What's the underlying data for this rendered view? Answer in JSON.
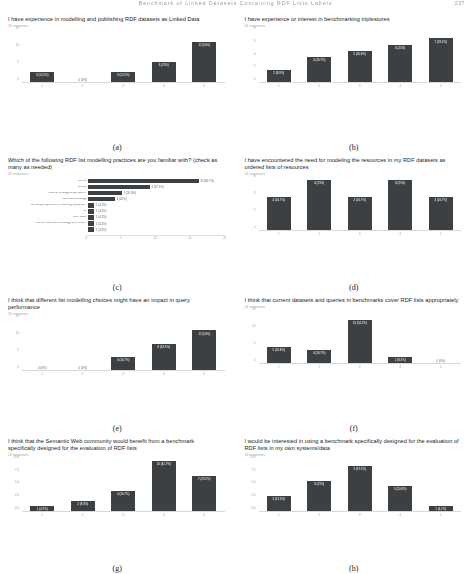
{
  "header": {
    "running_head": "Benchmark of Linked Datasets Containing RDF Lists Labels",
    "page_number": "237"
  },
  "panels": [
    {
      "letter": "(a)",
      "title": "I have experience in modelling and publishing RDF datasets as Linked Data",
      "responses": "24 responses",
      "chart_data": {
        "type": "bar",
        "orientation": "vertical",
        "categories": [
          "1",
          "2",
          "3",
          "4",
          "5"
        ],
        "values": [
          3,
          0,
          3,
          6,
          12
        ],
        "labels": [
          "3 (12.5%)",
          "0 (0%)",
          "3 (12.5%)",
          "6 (25%)",
          "12 (50%)"
        ],
        "ylim": [
          0,
          15
        ],
        "yticks": [
          0,
          5,
          10,
          15
        ],
        "ytick_labels": [
          "0",
          "5",
          "10",
          "15"
        ],
        "title": "I have experience in modelling and publishing RDF datasets as Linked Data",
        "xlabel": "",
        "ylabel": "",
        "grid": false,
        "legend": "none"
      }
    },
    {
      "letter": "(b)",
      "title": "I have experience or interest in benchmarking triplestores",
      "responses": "24 responses",
      "chart_data": {
        "type": "bar",
        "orientation": "vertical",
        "categories": [
          "1",
          "2",
          "3",
          "4",
          "5"
        ],
        "values": [
          2,
          4,
          5,
          6,
          7
        ],
        "labels": [
          "2 (8.3%)",
          "4 (16.7%)",
          "5 (20.8%)",
          "6 (25%)",
          "7 (29.2%)"
        ],
        "ylim": [
          0,
          8
        ],
        "yticks": [
          0,
          2,
          4,
          6,
          8
        ],
        "ytick_labels": [
          "0",
          "2",
          "4",
          "6",
          "8"
        ],
        "title": "I have experience or interest in benchmarking triplestores",
        "xlabel": "",
        "ylabel": "",
        "grid": false,
        "legend": "none"
      }
    },
    {
      "letter": "(c)",
      "title": "Which of the following RDF list modelling practices are you familiar with? (check as many as needed)",
      "responses": "24 responses",
      "chart_data": {
        "type": "bar",
        "orientation": "horizontal",
        "categories": [
          "rdf:List",
          "rdf:Seq",
          "I have an ontology design pattern",
          "Ordered-list ontology",
          "not enough experience in modelling a good de...",
          "no",
          "Don't know",
          "I use the Collection technology from Protér...",
          ""
        ],
        "values": [
          16,
          9,
          5,
          4,
          1,
          1,
          1,
          1,
          1
        ],
        "labels": [
          "16 (66.7%)",
          "9 (37.5%)",
          "5 (20.8%)",
          "4 (20%)",
          "1 (4.2%)",
          "1 (4.2%)",
          "1 (4.2%)",
          "1 (4.2%)",
          "1 (4.2%)"
        ],
        "xlim": [
          0,
          20
        ],
        "xticks": [
          0,
          5,
          10,
          15,
          20
        ],
        "xtick_labels": [
          "0",
          "5",
          "10",
          "15",
          "20"
        ],
        "title": "Which of the following RDF list modelling practices are you familiar with? (check as many as needed)",
        "xlabel": "",
        "ylabel": "",
        "grid": false,
        "legend": "none"
      }
    },
    {
      "letter": "(d)",
      "title": "I have encountered the need for modeling the resources in my RDF datasets as ordered lists of resources",
      "responses": "24 responses",
      "chart_data": {
        "type": "bar",
        "orientation": "vertical",
        "categories": [
          "1",
          "2",
          "3",
          "4",
          "5"
        ],
        "values": [
          4,
          6,
          4,
          6,
          4
        ],
        "labels": [
          "4 (16.7%)",
          "6 (25%)",
          "4 (16.7%)",
          "6 (25%)",
          "4 (16.7%)"
        ],
        "ylim": [
          0,
          6
        ],
        "yticks": [
          0,
          2,
          4,
          6
        ],
        "ytick_labels": [
          "0",
          "2",
          "4",
          "6"
        ],
        "title": "I have encountered the need for modeling the resources in my RDF datasets as ordered lists of resources",
        "xlabel": "",
        "ylabel": "",
        "grid": false,
        "legend": "none"
      }
    },
    {
      "letter": "(e)",
      "title": "I think that different list modelling choices might have an impact in query performance",
      "responses": "24 responses",
      "chart_data": {
        "type": "bar",
        "orientation": "vertical",
        "categories": [
          "1",
          "2",
          "3",
          "4",
          "5"
        ],
        "values": [
          0,
          0,
          4,
          8,
          12
        ],
        "labels": [
          "0 (0%)",
          "0 (0%)",
          "4 (16.7%)",
          "8 (33.3%)",
          "12 (50%)"
        ],
        "ylim": [
          0,
          15
        ],
        "yticks": [
          0,
          5,
          10,
          15
        ],
        "ytick_labels": [
          "0",
          "5",
          "10",
          "15"
        ],
        "title": "I think that different list modelling choices might have an impact in query performance",
        "xlabel": "",
        "ylabel": "",
        "grid": false,
        "legend": "none"
      }
    },
    {
      "letter": "(f)",
      "title": "I think that current datasets and queries in benchmarks cover RDF lists appropriately",
      "responses": "24 responses",
      "chart_data": {
        "type": "bar",
        "orientation": "vertical",
        "categories": [
          "1",
          "2",
          "3",
          "4",
          "5"
        ],
        "values": [
          5,
          4,
          13,
          2,
          0
        ],
        "labels": [
          "5 (20.8%)",
          "4 (16.7%)",
          "13 (54.2%)",
          "2 (8.3%)",
          "0 (0%)"
        ],
        "ylim": [
          0,
          15
        ],
        "yticks": [
          0,
          5,
          10,
          15
        ],
        "ytick_labels": [
          "0",
          "5",
          "10",
          "15"
        ],
        "title": "I think that current datasets and queries in benchmarks cover RDF lists appropriately",
        "xlabel": "",
        "ylabel": "",
        "grid": false,
        "legend": "none"
      }
    },
    {
      "letter": "(g)",
      "title": "I think that the Semantic Web community would benefit from a benchmark specifically designed for the evaluation of RDF lists",
      "responses": "24 responses",
      "chart_data": {
        "type": "bar",
        "orientation": "vertical",
        "categories": [
          "1",
          "2",
          "3",
          "4",
          "5"
        ],
        "values": [
          1,
          2,
          4,
          10,
          7
        ],
        "labels": [
          "1 (4.2%)",
          "2 (8.3%)",
          "4 (16.7%)",
          "10 (41.7%)",
          "7 (29.2%)"
        ],
        "ylim": [
          0,
          10
        ],
        "yticks": [
          0,
          2.5,
          5,
          7.5,
          10
        ],
        "ytick_labels": [
          "0.0",
          "2.5",
          "5.0",
          "7.5",
          "10.0"
        ],
        "title": "I think that the Semantic Web community would benefit from a benchmark specifically designed for the evaluation of RDF lists",
        "xlabel": "",
        "ylabel": "",
        "grid": false,
        "legend": "none"
      }
    },
    {
      "letter": "(h)",
      "title": "I would be interested in using a benchmark specifically designed for the evaluation of RDF lists in my own systems/data",
      "responses": "24 responses",
      "chart_data": {
        "type": "bar",
        "orientation": "vertical",
        "categories": [
          "1",
          "2",
          "3",
          "4",
          "5"
        ],
        "values": [
          3,
          6,
          9,
          5,
          1
        ],
        "labels": [
          "3 (12.5%)",
          "6 (25%)",
          "9 (37.5%)",
          "5 (20.8%)",
          "1 (4.2%)"
        ],
        "ylim": [
          0,
          10
        ],
        "yticks": [
          0,
          2.5,
          5,
          7.5,
          10
        ],
        "ytick_labels": [
          "0.0",
          "2.5",
          "5.0",
          "7.5",
          "10.0"
        ],
        "title": "I would be interested in using a benchmark specifically designed for the evaluation of RDF lists in my own systems/data",
        "xlabel": "",
        "ylabel": "",
        "grid": false,
        "legend": "none"
      }
    }
  ],
  "style": {
    "bar_color": "#3c4043",
    "axis_color": "#d8d8d8",
    "tick_text_color": "#9aa0a6"
  }
}
